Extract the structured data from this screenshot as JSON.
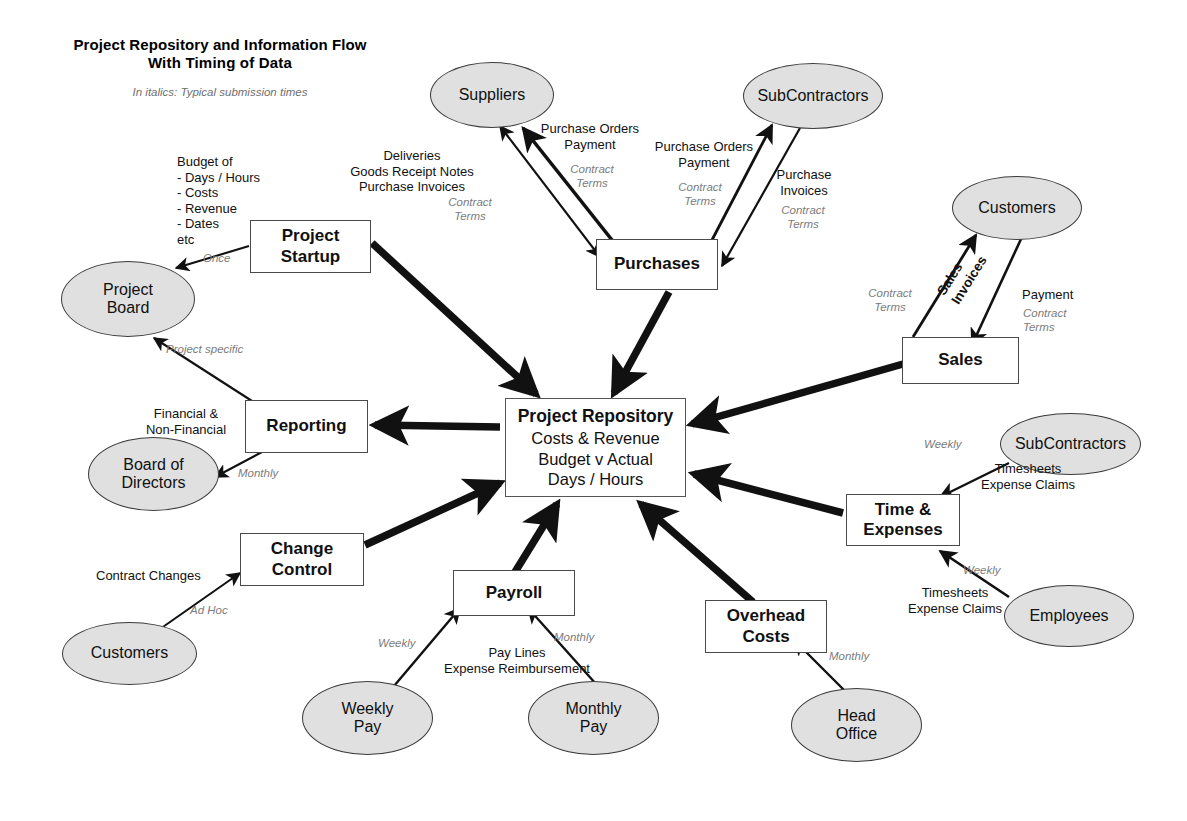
{
  "title": {
    "line1": "Project Repository and Information Flow",
    "line2": "With Timing of Data",
    "subtitle": "In italics: Typical submission times"
  },
  "colors": {
    "oval_fill": "#e0e0e0",
    "box_fill": "#ffffff",
    "stroke": "#3b3b3b",
    "italic_text": "#7c7c7c",
    "text": "#111111",
    "background": "#ffffff"
  },
  "nodes": {
    "project_startup": {
      "label": "Project Startup",
      "shape": "box"
    },
    "purchases": {
      "label": "Purchases",
      "shape": "box"
    },
    "sales": {
      "label": "Sales",
      "shape": "box"
    },
    "reporting": {
      "label": "Reporting",
      "shape": "box"
    },
    "change_control": {
      "label": "Change Control",
      "shape": "box"
    },
    "payroll": {
      "label": "Payroll",
      "shape": "box"
    },
    "overhead_costs": {
      "label": "Overhead Costs",
      "shape": "box"
    },
    "time_expenses": {
      "label": "Time & Expenses",
      "shape": "box"
    },
    "project_repository": {
      "shape": "box",
      "header": "Project Repository",
      "line1": "Costs & Revenue",
      "line2": "Budget v Actual",
      "line3": "Days / Hours"
    },
    "project_board": {
      "label": "Project Board",
      "shape": "oval"
    },
    "suppliers": {
      "label": "Suppliers",
      "shape": "oval"
    },
    "subcontractors_top": {
      "label": "SubContractors",
      "shape": "oval"
    },
    "customers_right": {
      "label": "Customers",
      "shape": "oval"
    },
    "subcontractors_right": {
      "label": "SubContractors",
      "shape": "oval"
    },
    "employees": {
      "label": "Employees",
      "shape": "oval"
    },
    "board_of_directors": {
      "label": "Board of Directors",
      "shape": "oval"
    },
    "customers_left": {
      "label": "Customers",
      "shape": "oval"
    },
    "weekly_pay": {
      "label": "Weekly Pay",
      "shape": "oval"
    },
    "monthly_pay": {
      "label": "Monthly Pay",
      "shape": "oval"
    },
    "head_office": {
      "label": "Head Office",
      "shape": "oval"
    }
  },
  "edge_labels": {
    "budget_of": "Budget of\n - Days / Hours\n - Costs\n - Revenue\n - Dates\netc",
    "startup_once": "Once",
    "deliveries_block": "Deliveries\nGoods Receipt Notes\nPurchase Invoices",
    "deliveries_terms": "Contract\nTerms",
    "po_payment_suppliers": "Purchase Orders\nPayment",
    "po_payment_suppliers_terms": "Contract\nTerms",
    "po_payment_subcon": "Purchase Orders\nPayment",
    "po_payment_subcon_terms": "Contract\nTerms",
    "purchase_invoices_subcon": "Purchase\nInvoices",
    "purchase_invoices_subcon_terms": "Contract\nTerms",
    "sales_invoices": "Sales\nInvoices",
    "sales_invoices_terms": "Contract\nTerms",
    "customer_payment": "Payment",
    "customer_payment_terms": "Contract\nTerms",
    "project_specific": "Project specific",
    "financial_nonfinancial": "Financial &\nNon-Financial",
    "reporting_monthly": "Monthly",
    "contract_changes": "Contract Changes",
    "ad_hoc": "Ad Hoc",
    "pay_lines": "Pay Lines\nExpense Reimbursement",
    "payroll_weekly": "Weekly",
    "payroll_monthly": "Monthly",
    "overhead_monthly": "Monthly",
    "timesheets_subcon": "Timesheets\nExpense Claims",
    "timesheets_subcon_freq": "Weekly",
    "timesheets_employees": "Timesheets\nExpense Claims",
    "timesheets_employees_freq": "Weekly"
  }
}
